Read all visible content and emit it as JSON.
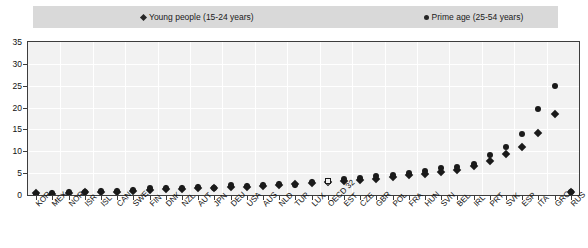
{
  "chart_data": {
    "type": "scatter",
    "title": "",
    "subtitle": "",
    "xlabel": "",
    "ylabel": "",
    "ylim": [
      0,
      35
    ],
    "yticks": [
      0,
      5,
      10,
      15,
      20,
      25,
      30,
      35
    ],
    "grid": true,
    "legend_position": "top",
    "legend": [
      {
        "name": "Young people (15-24 years)",
        "marker": "diamond",
        "color": "#1a1a1a"
      },
      {
        "name": "Prime age (25-54 years)",
        "marker": "circle",
        "color": "#1a1a1a"
      }
    ],
    "categories": [
      "KOR",
      "MEX",
      "NOR",
      "ISR",
      "ISL",
      "CAN",
      "SWE",
      "FIN",
      "DNK",
      "NZL",
      "AUT",
      "JPN",
      "DEU",
      "USA",
      "AUS",
      "NLD",
      "TUR",
      "LUX",
      "OECD 32",
      "EST",
      "CZE",
      "GBR",
      "POL",
      "FRA",
      "HUN",
      "SVN",
      "BEL",
      "IRL",
      "PRT",
      "SVK",
      "ESP",
      "ITA",
      "GRC",
      "RUS"
    ],
    "series": [
      {
        "name": "Young people (15-24 years)",
        "marker": "diamond",
        "values": [
          0.4,
          0.3,
          0.5,
          0.6,
          0.7,
          0.8,
          0.9,
          1.1,
          1.3,
          1.4,
          1.5,
          1.6,
          1.8,
          1.9,
          2.1,
          2.3,
          2.5,
          2.7,
          3.0,
          3.2,
          3.5,
          3.7,
          4.2,
          4.6,
          4.9,
          5.3,
          5.8,
          6.6,
          7.8,
          9.3,
          11.0,
          14.2,
          18.5,
          0.8
        ]
      },
      {
        "name": "Prime age (25-54 years)",
        "marker": "circle",
        "values": [
          0.3,
          0.5,
          0.6,
          0.8,
          0.9,
          1.0,
          1.2,
          1.6,
          1.7,
          1.5,
          1.8,
          1.7,
          2.2,
          2.1,
          2.4,
          2.6,
          2.4,
          2.9,
          3.1,
          3.6,
          3.8,
          4.3,
          4.6,
          5.1,
          5.4,
          6.2,
          6.5,
          7.2,
          9.1,
          11.0,
          14.0,
          19.6,
          25.0,
          0.6
        ]
      }
    ],
    "note": "Marker positions for OECD 32 are drawn hollow/open to distinguish the aggregate from individual countries."
  },
  "axis": {
    "y_unit": "",
    "x_rotation_deg": -45
  }
}
